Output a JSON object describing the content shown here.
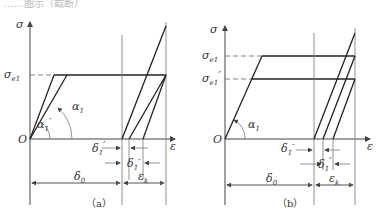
{
  "top_text": "……图示（截断）",
  "figure_a": {
    "caption": "（a）",
    "y_axis": "σ",
    "x_axis": "ε",
    "origin": "O",
    "stress_label": "σe1",
    "angles": [
      "α1",
      "α1''"
    ],
    "dims": [
      "δ1'",
      "δ1''",
      "δ0",
      "εk"
    ]
  },
  "figure_b": {
    "caption": "（b）",
    "y_axis": "σ",
    "x_axis": "ε",
    "origin": "O",
    "stress_labels": [
      "σe1",
      "σe1'"
    ],
    "angles": [
      "α1"
    ],
    "dims": [
      "δ1''",
      "δ1'",
      "δ0",
      "εk"
    ]
  }
}
